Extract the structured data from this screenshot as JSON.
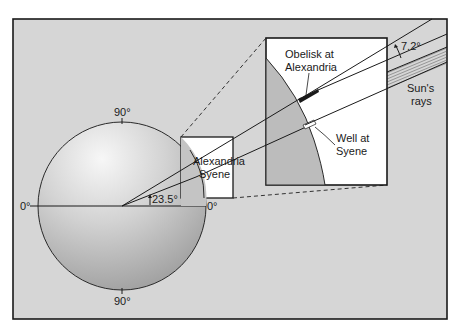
{
  "diagram": {
    "type": "Eratosthenes Earth circumference measurement",
    "colors": {
      "frame_bg": "#d6d6d6",
      "frame_stroke": "#1a1a1a",
      "globe_light": "#f2f2f2",
      "globe_dark": "#a8a8a8",
      "inset_bg": "#ffffff",
      "inset_earth": "#b9b9b9"
    },
    "globe": {
      "label_top": "90°",
      "label_bottom": "90°",
      "label_left": "0°",
      "label_right": "0°",
      "angle_label": "23.5°"
    },
    "small_box": {
      "label_alexandria": "Alexandria",
      "label_syene": "Syene"
    },
    "inset": {
      "obelisk_label_line1": "Obelisk at",
      "obelisk_label_line2": "Alexandria",
      "well_label_line1": "Well at",
      "well_label_line2": "Syene",
      "angle_label": "7.2°"
    },
    "rays": {
      "label_line1": "Sun's",
      "label_line2": "rays"
    }
  }
}
